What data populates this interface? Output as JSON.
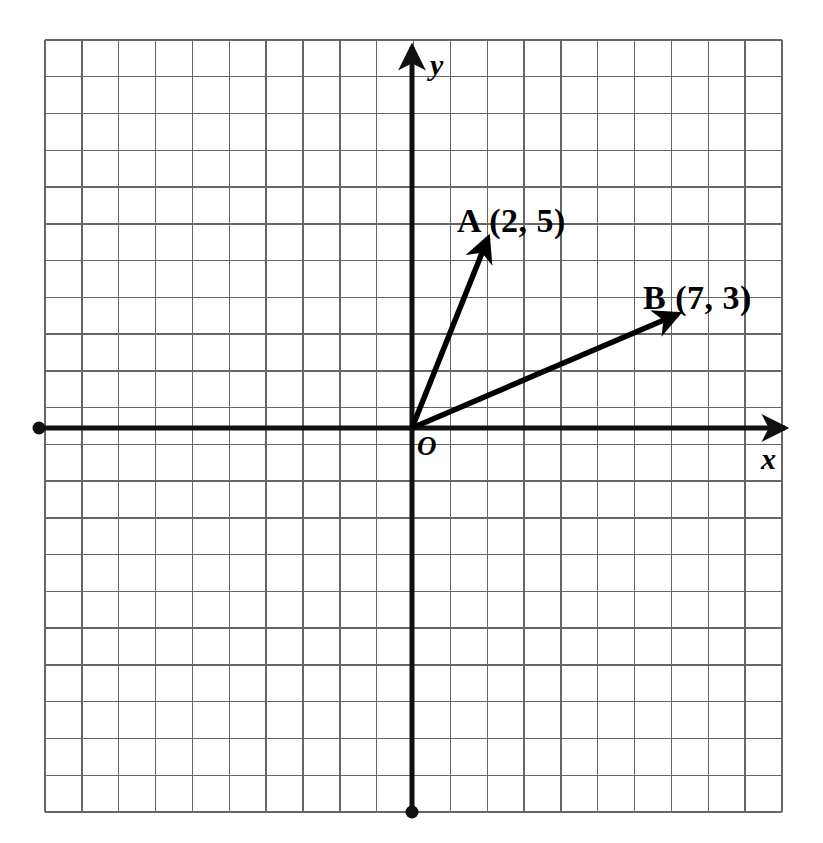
{
  "figure": {
    "background_color": "#ffffff",
    "ink_color": "#000000",
    "grid_color": "#666666"
  },
  "grid": {
    "left": 45,
    "top": 40,
    "right": 782,
    "bottom": 812,
    "columns": 20,
    "rows": 21,
    "cell_size": 36.85,
    "line_width": 1.4,
    "color": "#666666"
  },
  "axes": {
    "origin_x": 412,
    "origin_y": 428,
    "line_width": 5,
    "color": "#111111",
    "x_axis": {
      "label": "x",
      "start_x": 39,
      "end_x": 785,
      "y": 428,
      "arrow_end": "right",
      "dot_end": "left",
      "dot_radius": 6.5,
      "label_x": 761,
      "label_y": 444
    },
    "y_axis": {
      "label": "y",
      "x": 412,
      "start_y": 812,
      "end_y": 47,
      "arrow_end": "top",
      "dot_end": "bottom",
      "dot_radius": 6.5,
      "label_x": 430,
      "label_y": 50
    },
    "origin_label": "O"
  },
  "vectors": [
    {
      "name": "A",
      "label": "A (2, 5)",
      "coordinates": [
        2,
        5
      ],
      "x": 2,
      "y": 5,
      "tip_px_x": 488,
      "tip_px_y": 238,
      "line_width": 5.5,
      "color": "#000000",
      "label_px_x": 457,
      "label_px_y": 204
    },
    {
      "name": "B",
      "label": "B (7, 3)",
      "coordinates": [
        7,
        3
      ],
      "x": 7,
      "y": 3,
      "tip_px_x": 678,
      "tip_px_y": 314,
      "line_width": 5.5,
      "color": "#000000",
      "label_px_x": 643,
      "label_px_y": 281
    }
  ],
  "chart_data": {
    "type": "scatter",
    "title": "",
    "xlabel": "x",
    "ylabel": "y",
    "grid": true,
    "legend_position": "none",
    "xlim": [
      -10,
      10
    ],
    "ylim": [
      -10.5,
      10.5
    ],
    "series": [
      {
        "name": "A (2, 5)",
        "values": [
          [
            2,
            5
          ]
        ],
        "render": "vector-from-origin"
      },
      {
        "name": "B (7, 3)",
        "values": [
          [
            7,
            3
          ]
        ],
        "render": "vector-from-origin"
      }
    ],
    "annotations": [
      {
        "text": "A (2, 5)",
        "x": 2,
        "y": 5
      },
      {
        "text": "B (7, 3)",
        "x": 7,
        "y": 3
      },
      {
        "text": "O",
        "x": 0,
        "y": 0
      }
    ]
  }
}
